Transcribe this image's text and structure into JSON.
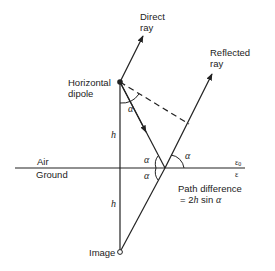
{
  "diagram": {
    "labels": {
      "direct_ray_line1": "Direct",
      "direct_ray_line2": "ray",
      "reflected_ray_line1": "Reflected",
      "reflected_ray_line2": "ray",
      "dipole_line1": "Horizontal",
      "dipole_line2": "dipole",
      "air": "Air",
      "ground": "Ground",
      "image": "Image",
      "height_upper": "h",
      "height_lower": "h",
      "epsilon0": "ε",
      "epsilon0_sub": "0",
      "epsilon": "ε",
      "path_diff_line1": "Path difference",
      "path_diff_eq": "= 2",
      "path_diff_h": "h",
      "path_diff_sin": " sin ",
      "path_diff_alpha": "α",
      "alpha": "α"
    },
    "colors": {
      "line": "#222222",
      "background": "#ffffff"
    }
  }
}
